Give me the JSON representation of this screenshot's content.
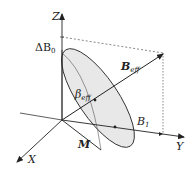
{
  "diagram": {
    "axes": {
      "z": "Z",
      "y": "Y",
      "x": "X"
    },
    "labels": {
      "delta_b0_main": "ΔB",
      "delta_b0_sub": "0",
      "b_eff_main": "B",
      "b_eff_sub": "eff",
      "beta_eff_main": "β",
      "beta_eff_sub": "eff",
      "b1_main": "B",
      "b1_sub": "1",
      "m": "M"
    },
    "colors": {
      "stroke": "#333333",
      "cone_fill": "#e6e6e6",
      "dashed": "#555555"
    }
  }
}
